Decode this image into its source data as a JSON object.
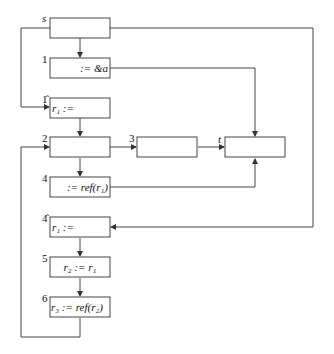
{
  "diagram": {
    "type": "control-flow-graph",
    "nodes": [
      {
        "id": "s",
        "label": "s",
        "code": ""
      },
      {
        "id": "1",
        "label": "1",
        "code": ":= &a"
      },
      {
        "id": "1hat",
        "label": "1̂",
        "code": "r₁ :="
      },
      {
        "id": "2",
        "label": "2",
        "code": ""
      },
      {
        "id": "3",
        "label": "3",
        "code": ""
      },
      {
        "id": "t",
        "label": "t",
        "code": ""
      },
      {
        "id": "4",
        "label": "4",
        "code": ":= ref(r₁)"
      },
      {
        "id": "4hat",
        "label": "4̂",
        "code": "r₁ :="
      },
      {
        "id": "5",
        "label": "5",
        "code": "r₂ := r₁"
      },
      {
        "id": "6",
        "label": "6",
        "code": "r₃ := ref(r₂)"
      }
    ],
    "edges": [
      [
        "s",
        "1"
      ],
      [
        "s",
        "1hat"
      ],
      [
        "s",
        "4hat"
      ],
      [
        "1",
        "t"
      ],
      [
        "1hat",
        "2"
      ],
      [
        "2",
        "3"
      ],
      [
        "2",
        "4"
      ],
      [
        "3",
        "t"
      ],
      [
        "4",
        "t"
      ],
      [
        "4hat",
        "5"
      ],
      [
        "5",
        "6"
      ],
      [
        "6",
        "2"
      ]
    ]
  }
}
